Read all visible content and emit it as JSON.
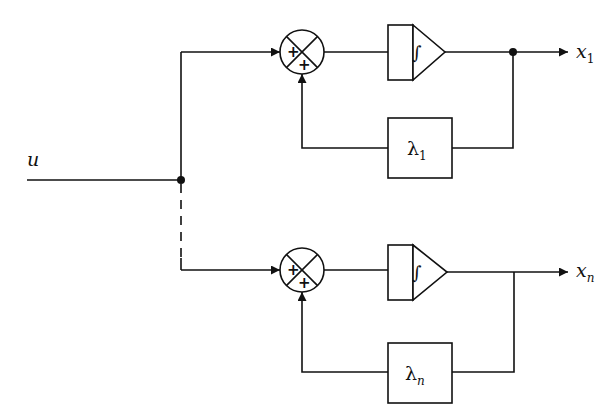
{
  "diagram": {
    "type": "block-diagram",
    "input": {
      "label": "u"
    },
    "branches": [
      {
        "id": "branch-1",
        "summing_junction": {
          "signs": [
            "+",
            "+"
          ]
        },
        "integrator": {
          "symbol": "∫"
        },
        "feedback_gain": {
          "symbol": "λ",
          "subscript": "1"
        },
        "output": {
          "label": "x",
          "subscript": "1"
        },
        "has_output_junction_dot": true
      },
      {
        "id": "branch-n",
        "summing_junction": {
          "signs": [
            "+",
            "+"
          ]
        },
        "integrator": {
          "symbol": "∫"
        },
        "feedback_gain": {
          "symbol": "λ",
          "subscript": "n"
        },
        "output": {
          "label": "x",
          "subscript": "n"
        },
        "has_output_junction_dot": false
      }
    ],
    "ellipsis_connector": "dashed vertical line between branch 1 and branch n"
  }
}
